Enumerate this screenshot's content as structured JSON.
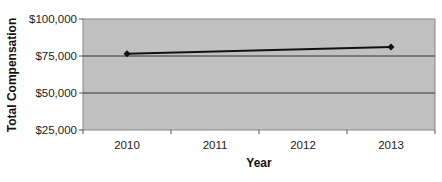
{
  "chart_data": {
    "type": "line",
    "title": "",
    "xlabel": "Year",
    "ylabel": "Total Compensation",
    "categories": [
      "2010",
      "2011",
      "2012",
      "2013"
    ],
    "series": [
      {
        "name": "Total Compensation",
        "x": [
          "2010",
          "2013"
        ],
        "values": [
          76500,
          81000
        ],
        "color": "#111111",
        "marker": "diamond"
      }
    ],
    "yticks": [
      25000,
      50000,
      75000,
      100000
    ],
    "ytick_labels": [
      "$25,000",
      "$50,000",
      "$75,000",
      "$100,000"
    ],
    "ylim": [
      25000,
      100000
    ],
    "grid": true,
    "legend": null,
    "plot_background": "#c0c0c0"
  }
}
